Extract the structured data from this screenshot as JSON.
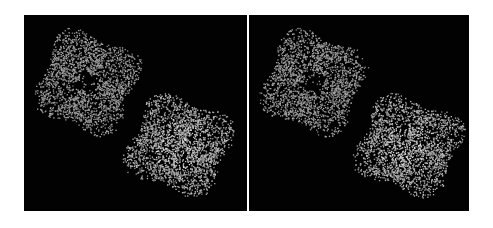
{
  "figure": {
    "type": "stereo-pair",
    "background": "#ffffff",
    "panel_color": "#020202",
    "dot_color_dim": "#8a8a8a",
    "dot_color_bright": "#e6e6e6",
    "panels": [
      {
        "id": "left",
        "particles": [
          {
            "name": "upper-particle",
            "cx": 63,
            "cy": 67,
            "rx": 50,
            "ry": 50,
            "hole": true,
            "brightness": 0.75,
            "seed": 11
          },
          {
            "name": "lower-particle",
            "cx": 155,
            "cy": 130,
            "rx": 52,
            "ry": 48,
            "hole": false,
            "brightness": 0.95,
            "seed": 23
          }
        ]
      },
      {
        "id": "right",
        "particles": [
          {
            "name": "upper-particle",
            "cx": 64,
            "cy": 67,
            "rx": 50,
            "ry": 50,
            "hole": true,
            "brightness": 0.75,
            "seed": 37
          },
          {
            "name": "lower-particle",
            "cx": 159,
            "cy": 130,
            "rx": 52,
            "ry": 48,
            "hole": false,
            "brightness": 0.95,
            "seed": 41
          }
        ]
      }
    ]
  }
}
